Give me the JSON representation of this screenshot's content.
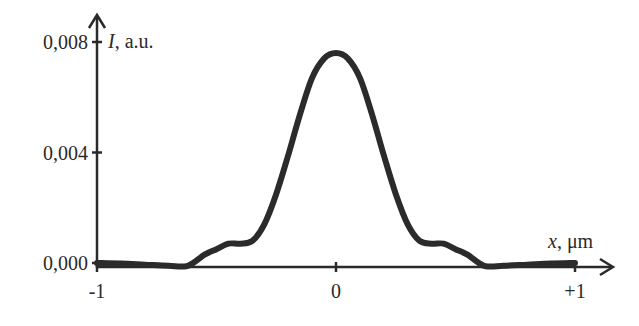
{
  "chart_data": {
    "type": "line",
    "title": "",
    "xlabel_var": "x",
    "xlabel_unit": ", μm",
    "ylabel_var": "I",
    "ylabel_unit": ", a.u.",
    "xlim": [
      -1,
      1.15
    ],
    "ylim": [
      -0.0002,
      0.0085
    ],
    "x_ticks": [
      -1,
      0,
      1
    ],
    "x_tick_labels": [
      "-1",
      "0",
      "+1"
    ],
    "y_ticks": [
      0.0,
      0.004,
      0.008
    ],
    "y_tick_labels": [
      "0,000",
      "0,004",
      "0,008"
    ],
    "grid": false,
    "legend": false,
    "series": [
      {
        "name": "I(x)",
        "color": "#2b2b2b",
        "x": [
          -1.0,
          -0.9,
          -0.8,
          -0.7,
          -0.62,
          -0.55,
          -0.5,
          -0.45,
          -0.4,
          -0.35,
          -0.3,
          -0.25,
          -0.2,
          -0.15,
          -0.1,
          -0.05,
          0.0,
          0.05,
          0.1,
          0.15,
          0.2,
          0.25,
          0.3,
          0.35,
          0.4,
          0.45,
          0.5,
          0.55,
          0.62,
          0.7,
          0.8,
          0.9,
          1.0
        ],
        "y": [
          0.0,
          -2e-05,
          -6e-05,
          -0.0001,
          -0.0001,
          0.0003,
          0.0005,
          0.0007,
          0.0007,
          0.0008,
          0.0014,
          0.0025,
          0.0039,
          0.0054,
          0.0067,
          0.0074,
          0.0076,
          0.0074,
          0.0067,
          0.0054,
          0.0039,
          0.0025,
          0.0014,
          0.0008,
          0.0007,
          0.0007,
          0.0005,
          0.0003,
          -0.0001,
          -0.0001,
          -6e-05,
          -2e-05,
          0.0
        ]
      }
    ]
  }
}
